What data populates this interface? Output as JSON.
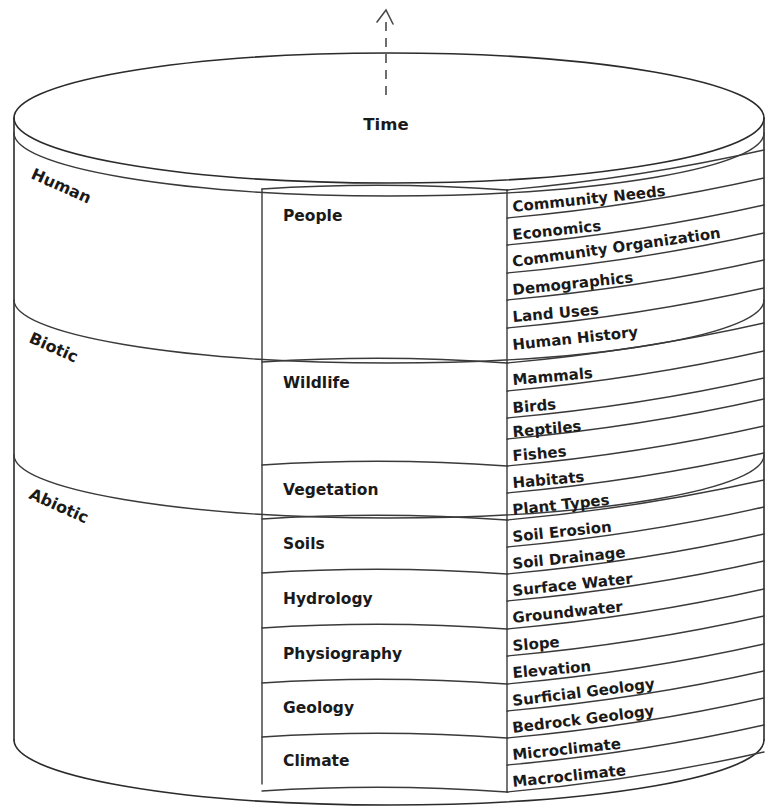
{
  "diagram": {
    "title_axis": "Time",
    "axis_icon": "up-arrow-icon",
    "shape": "layered-cylinder",
    "domains": [
      {
        "id": "human",
        "label": "Human"
      },
      {
        "id": "biotic",
        "label": "Biotic"
      },
      {
        "id": "abiotic",
        "label": "Abiotic"
      }
    ],
    "categories": [
      {
        "id": "people",
        "label": "People",
        "domain": "Human",
        "sub_count": 6
      },
      {
        "id": "wildlife",
        "label": "Wildlife",
        "domain": "Biotic",
        "sub_count": 4
      },
      {
        "id": "vegetation",
        "label": "Vegetation",
        "domain": "Biotic",
        "sub_count": 2
      },
      {
        "id": "soils",
        "label": "Soils",
        "domain": "Abiotic",
        "sub_count": 2
      },
      {
        "id": "hydrology",
        "label": "Hydrology",
        "domain": "Abiotic",
        "sub_count": 2
      },
      {
        "id": "physiography",
        "label": "Physiography",
        "domain": "Abiotic",
        "sub_count": 2
      },
      {
        "id": "geology",
        "label": "Geology",
        "domain": "Abiotic",
        "sub_count": 2
      },
      {
        "id": "climate",
        "label": "Climate",
        "domain": "Abiotic",
        "sub_count": 2
      }
    ],
    "subcategories": [
      {
        "label": "Community Needs",
        "category": "People"
      },
      {
        "label": "Economics",
        "category": "People"
      },
      {
        "label": "Community Organization",
        "category": "People"
      },
      {
        "label": "Demographics",
        "category": "People"
      },
      {
        "label": "Land Uses",
        "category": "People"
      },
      {
        "label": "Human History",
        "category": "People"
      },
      {
        "label": "Mammals",
        "category": "Wildlife"
      },
      {
        "label": "Birds",
        "category": "Wildlife"
      },
      {
        "label": "Reptiles",
        "category": "Wildlife"
      },
      {
        "label": "Fishes",
        "category": "Wildlife"
      },
      {
        "label": "Habitats",
        "category": "Vegetation"
      },
      {
        "label": "Plant Types",
        "category": "Vegetation"
      },
      {
        "label": "Soil Erosion",
        "category": "Soils"
      },
      {
        "label": "Soil Drainage",
        "category": "Soils"
      },
      {
        "label": "Surface Water",
        "category": "Hydrology"
      },
      {
        "label": "Groundwater",
        "category": "Hydrology"
      },
      {
        "label": "Slope",
        "category": "Physiography"
      },
      {
        "label": "Elevation",
        "category": "Physiography"
      },
      {
        "label": "Surficial Geology",
        "category": "Geology"
      },
      {
        "label": "Bedrock Geology",
        "category": "Geology"
      },
      {
        "label": "Microclimate",
        "category": "Climate"
      },
      {
        "label": "Macroclimate",
        "category": "Climate"
      }
    ],
    "colors": {
      "stroke": "#2b2b2b",
      "text": "#1a1a1a",
      "background": "#ffffff",
      "axis": "#4a4a4a"
    }
  }
}
